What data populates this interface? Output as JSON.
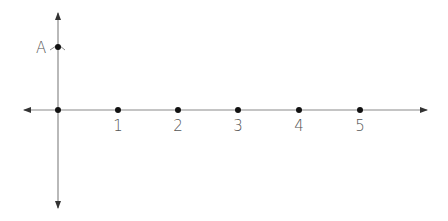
{
  "diagram": {
    "type": "coordinate-plane",
    "colors": {
      "axis": "#8a8a8a",
      "point": "#111111",
      "label": "#555555"
    },
    "point_a": {
      "label": "A",
      "cx": 58,
      "cy": 47
    },
    "origin": {
      "cx": 58,
      "cy": 110
    },
    "x_points": [
      {
        "label": "1",
        "cx": 118
      },
      {
        "label": "2",
        "cx": 178
      },
      {
        "label": "3",
        "cx": 238
      },
      {
        "label": "4",
        "cx": 299
      },
      {
        "label": "5",
        "cx": 360
      }
    ]
  }
}
